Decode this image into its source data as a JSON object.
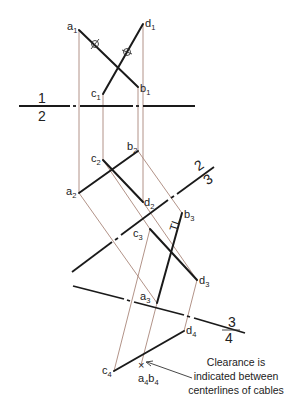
{
  "diagram": {
    "fold_lines": {
      "f12": {
        "top": "1",
        "bottom": "2"
      },
      "f23": {
        "top": "2",
        "bottom": "3"
      },
      "f34": {
        "top": "3",
        "bottom": "4"
      }
    },
    "points": {
      "a1": {
        "letter": "a",
        "sub": "1"
      },
      "b1": {
        "letter": "b",
        "sub": "1"
      },
      "c1": {
        "letter": "c",
        "sub": "1"
      },
      "d1": {
        "letter": "d",
        "sub": "1"
      },
      "a2": {
        "letter": "a",
        "sub": "2"
      },
      "b2": {
        "letter": "b",
        "sub": "2"
      },
      "c2": {
        "letter": "c",
        "sub": "2"
      },
      "d2": {
        "letter": "d",
        "sub": "2"
      },
      "a3": {
        "letter": "a",
        "sub": "3"
      },
      "b3": {
        "letter": "b",
        "sub": "3"
      },
      "c3": {
        "letter": "c",
        "sub": "3"
      },
      "d3": {
        "letter": "d",
        "sub": "3"
      },
      "c4": {
        "letter": "c",
        "sub": "4"
      },
      "d4": {
        "letter": "d",
        "sub": "4"
      },
      "a4b4": {
        "a": "a",
        "a_sub": "4",
        "b": "b",
        "b_sub": "4"
      }
    },
    "true_length_label": "TL",
    "point_view_marker": "×",
    "centerline_symbol": "℄",
    "note": {
      "line1": "Clearance is",
      "line2": "indicated between",
      "line3": "centerlines of cables"
    }
  }
}
